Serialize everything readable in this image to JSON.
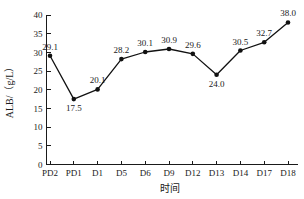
{
  "chart_data": {
    "type": "line",
    "title": "",
    "xlabel": "时间",
    "ylabel": "ALB/（g/L）",
    "categories": [
      "PD2",
      "PD1",
      "D1",
      "D5",
      "D6",
      "D9",
      "D12",
      "D13",
      "D14",
      "D17",
      "D18"
    ],
    "values": [
      29.1,
      17.5,
      20.1,
      28.2,
      30.1,
      30.9,
      29.6,
      24.0,
      30.5,
      32.7,
      38.0
    ],
    "point_labels": [
      "29.1",
      "17.5",
      "20.1",
      "28.2",
      "30.1",
      "30.9",
      "29.6",
      "24.0",
      "30.5",
      "32.7",
      "38.0"
    ],
    "label_positions": [
      "above",
      "below",
      "above",
      "above",
      "above",
      "above",
      "above",
      "below",
      "above",
      "above",
      "above"
    ],
    "ylim": [
      0,
      40
    ],
    "ytick_values": [
      0,
      5,
      10,
      15,
      20,
      25,
      30,
      35,
      40
    ],
    "ytick_labels": [
      "0",
      "5",
      "10",
      "15",
      "20",
      "25",
      "30",
      "35",
      "40"
    ],
    "grid": false,
    "legend": "none",
    "marker": "filled-circle",
    "line_color": "#111111",
    "axis_color": "#1a1a1a",
    "tick_direction": "in"
  },
  "axes": {
    "y_title": "ALB/（g/L）",
    "x_title": "时间"
  }
}
